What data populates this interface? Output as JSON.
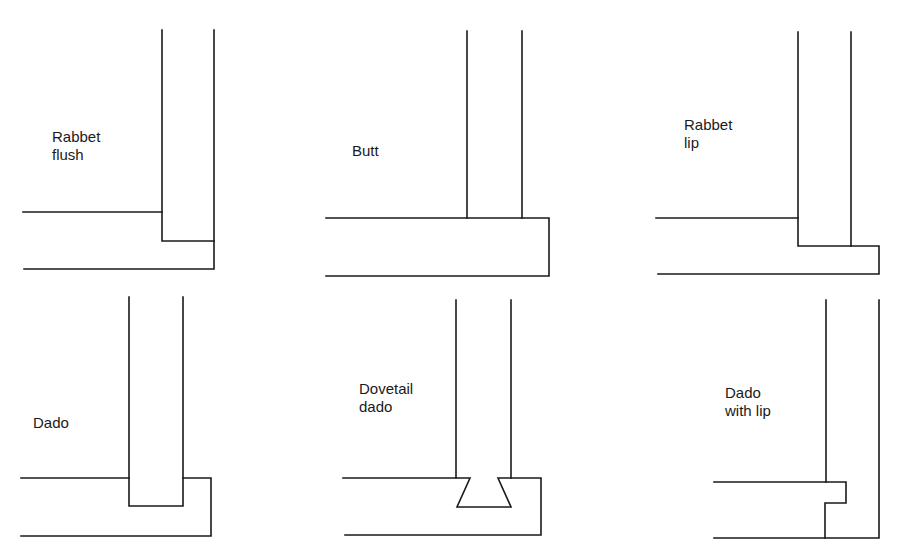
{
  "diagram": {
    "type": "woodworking-joint-cross-sections",
    "line_color": "#1a1a1a",
    "background": "#ffffff",
    "joints": [
      {
        "id": "rabbet-flush",
        "label_lines": [
          "Rabbet",
          "flush"
        ],
        "row": 1,
        "column": 1
      },
      {
        "id": "butt",
        "label_lines": [
          "Butt"
        ],
        "row": 1,
        "column": 2
      },
      {
        "id": "rabbet-lip",
        "label_lines": [
          "Rabbet",
          "lip"
        ],
        "row": 1,
        "column": 3
      },
      {
        "id": "dado",
        "label_lines": [
          "Dado"
        ],
        "row": 2,
        "column": 1
      },
      {
        "id": "dovetail-dado",
        "label_lines": [
          "Dovetail",
          "dado"
        ],
        "row": 2,
        "column": 2
      },
      {
        "id": "dado-with-lip",
        "label_lines": [
          "Dado",
          "with lip"
        ],
        "row": 2,
        "column": 3
      }
    ]
  }
}
